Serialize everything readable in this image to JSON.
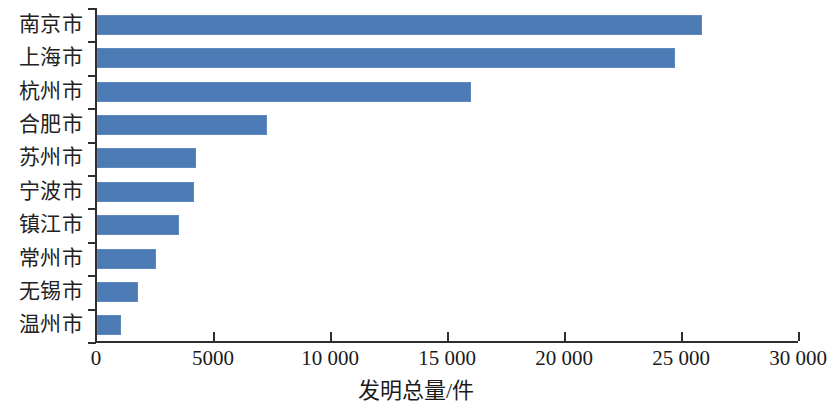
{
  "chart_data": {
    "type": "bar",
    "orientation": "horizontal",
    "title": "",
    "xlabel": "发明总量/件",
    "ylabel": "",
    "categories": [
      "南京市",
      "上海市",
      "杭州市",
      "合肥市",
      "苏州市",
      "宁波市",
      "镇江市",
      "常州市",
      "无锡市",
      "温州市"
    ],
    "values": [
      25850,
      24700,
      16000,
      7270,
      4230,
      4150,
      3510,
      2530,
      1755,
      1030
    ],
    "series": [
      {
        "name": "发明总量",
        "values": [
          25850,
          24700,
          16000,
          7270,
          4230,
          4150,
          3510,
          2530,
          1755,
          1030
        ]
      }
    ],
    "xlim": [
      0,
      30000
    ],
    "xticks": [
      0,
      5000,
      10000,
      15000,
      20000,
      25000,
      30000
    ],
    "xtick_labels": [
      "0",
      "5000",
      "10 000",
      "15 000",
      "20 000",
      "25 000",
      "30 000"
    ],
    "grid": false,
    "legend": false,
    "bar_color": "#4c7ab5",
    "axis_color": "#2e2e2e"
  },
  "axis": {
    "x_title": "发明总量/件"
  }
}
